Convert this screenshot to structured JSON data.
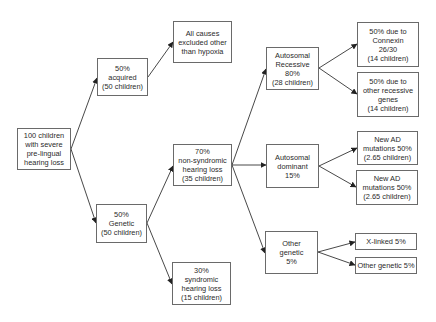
{
  "diagram": {
    "type": "flowchart",
    "title": "",
    "nodes": {
      "root": {
        "label": "100 children\nwith severe\npre-lingual\nhearing loss"
      },
      "acquired": {
        "label": "50%\nacquired\n(50 children)"
      },
      "hypoxia": {
        "label": "All causes\nexcluded other\nthan hypoxia"
      },
      "genetic": {
        "label": "50%\nGenetic\n(50 children)"
      },
      "non_syndromic": {
        "label": "70%\nnon-syndromic\nhearing loss\n(35 children)"
      },
      "syndromic": {
        "label": "30%\nsyndromic\nhearing loss\n(15 children)"
      },
      "autosomal_recessive": {
        "label": "Autosomal\nRecessive\n80%\n(28 children)"
      },
      "autosomal_dominant": {
        "label": "Autosomal\ndominant\n15%"
      },
      "other_genetic_parent": {
        "label": "Other\ngenetic\n5%"
      },
      "connexin": {
        "label": "50% due to\nConnexin\n26/30\n(14 children)"
      },
      "other_recessive": {
        "label": "50% due to\nother recessive\ngenes\n(14 children)"
      },
      "new_ad_1": {
        "label": "New AD\nmutations 50%\n(2.65 children)"
      },
      "new_ad_2": {
        "label": "New AD\nmutations 50%\n(2.65 children)"
      },
      "x_linked": {
        "label": "X-linked 5%"
      },
      "other_genetic_leaf": {
        "label": "Other genetic 5%"
      }
    },
    "edges": [
      {
        "from": "root",
        "to": "acquired"
      },
      {
        "from": "root",
        "to": "genetic"
      },
      {
        "from": "acquired",
        "to": "hypoxia"
      },
      {
        "from": "genetic",
        "to": "non_syndromic"
      },
      {
        "from": "genetic",
        "to": "syndromic"
      },
      {
        "from": "non_syndromic",
        "to": "autosomal_recessive"
      },
      {
        "from": "non_syndromic",
        "to": "autosomal_dominant"
      },
      {
        "from": "non_syndromic",
        "to": "other_genetic_parent"
      },
      {
        "from": "autosomal_recessive",
        "to": "connexin"
      },
      {
        "from": "autosomal_recessive",
        "to": "other_recessive"
      },
      {
        "from": "autosomal_dominant",
        "to": "new_ad_1"
      },
      {
        "from": "autosomal_dominant",
        "to": "new_ad_2"
      },
      {
        "from": "other_genetic_parent",
        "to": "x_linked"
      },
      {
        "from": "other_genetic_parent",
        "to": "other_genetic_leaf"
      }
    ],
    "colors": {
      "border": "#6a6a6a",
      "text": "#2a2a2a",
      "edge": "#333333",
      "background": "#ffffff"
    }
  }
}
